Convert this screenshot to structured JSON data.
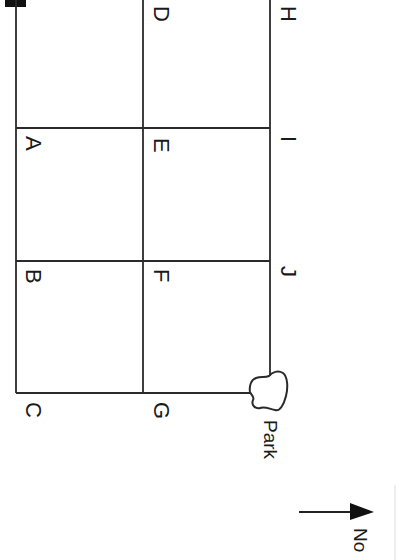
{
  "diagram": {
    "type": "street-grid-map",
    "orientation": "rotated-90-clockwise",
    "stroke_color": "#2a2a2a",
    "intersections": [
      {
        "id": "D",
        "label": "D"
      },
      {
        "id": "H",
        "label": "H"
      },
      {
        "id": "A",
        "label": "A"
      },
      {
        "id": "E",
        "label": "E"
      },
      {
        "id": "I",
        "label": "I"
      },
      {
        "id": "B",
        "label": "B"
      },
      {
        "id": "F",
        "label": "F"
      },
      {
        "id": "J",
        "label": "J"
      },
      {
        "id": "C",
        "label": "C"
      },
      {
        "id": "G",
        "label": "G"
      }
    ],
    "landmark": {
      "label": "Park"
    },
    "compass": {
      "label": "No"
    }
  }
}
